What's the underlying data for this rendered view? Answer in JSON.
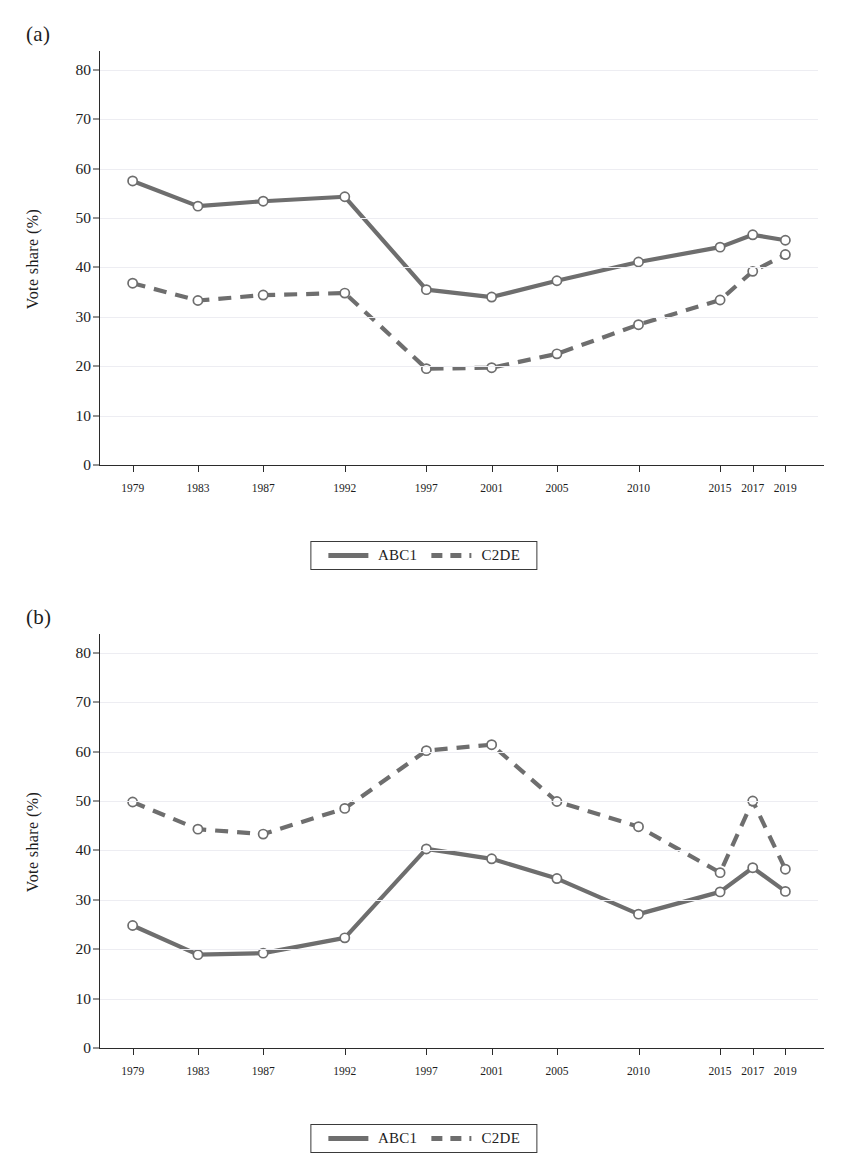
{
  "figure": {
    "panels": [
      {
        "label": "(a)",
        "ylabel": "Vote share (%)"
      },
      {
        "label": "(b)",
        "ylabel": "Vote share (%)"
      }
    ]
  },
  "style": {
    "series_color": "#6e6e6e",
    "marker_fill": "#ffffff",
    "marker_stroke": "#6e6e6e",
    "axis_color": "#2b2b2b",
    "grid_color": "#ededf2",
    "background": "#ffffff"
  },
  "chart_data": [
    {
      "type": "line",
      "panel": "(a)",
      "title": "",
      "xlabel": "",
      "ylabel": "Vote share (%)",
      "x": [
        1979,
        1983,
        1987,
        1992,
        1997,
        2001,
        2005,
        2010,
        2015,
        2017,
        2019
      ],
      "categories": [
        "1979",
        "1983",
        "1987",
        "1992",
        "1997",
        "2001",
        "2005",
        "2010",
        "2015",
        "2017",
        "2019"
      ],
      "xlim": [
        1977,
        2021
      ],
      "ylim": [
        0,
        83
      ],
      "yticks": [
        0,
        10,
        20,
        30,
        40,
        50,
        60,
        70,
        80
      ],
      "ytick_labels": [
        "0",
        "10",
        "20",
        "30",
        "40",
        "50",
        "60",
        "70",
        "80"
      ],
      "grid": true,
      "grid_axis": "y",
      "legend_position": "bottom-center",
      "series": [
        {
          "name": "ABC1",
          "linestyle": "solid",
          "values": [
            57.5,
            52.4,
            53.4,
            54.3,
            35.5,
            34.0,
            37.3,
            41.1,
            44.1,
            46.6,
            45.5
          ]
        },
        {
          "name": "C2DE",
          "linestyle": "dashed",
          "values": [
            36.8,
            33.3,
            34.4,
            34.8,
            19.5,
            19.7,
            22.5,
            28.4,
            33.4,
            39.2,
            42.6
          ]
        }
      ]
    },
    {
      "type": "line",
      "panel": "(b)",
      "title": "",
      "xlabel": "",
      "ylabel": "Vote share (%)",
      "x": [
        1979,
        1983,
        1987,
        1992,
        1997,
        2001,
        2005,
        2010,
        2015,
        2017,
        2019
      ],
      "categories": [
        "1979",
        "1983",
        "1987",
        "1992",
        "1997",
        "2001",
        "2005",
        "2010",
        "2015",
        "2017",
        "2019"
      ],
      "xlim": [
        1977,
        2021
      ],
      "ylim": [
        0,
        83
      ],
      "yticks": [
        0,
        10,
        20,
        30,
        40,
        50,
        60,
        70,
        80
      ],
      "ytick_labels": [
        "0",
        "10",
        "20",
        "30",
        "40",
        "50",
        "60",
        "70",
        "80"
      ],
      "grid": true,
      "grid_axis": "y",
      "legend_position": "bottom-center",
      "series": [
        {
          "name": "ABC1",
          "linestyle": "solid",
          "values": [
            24.8,
            18.9,
            19.2,
            22.3,
            40.3,
            38.3,
            34.3,
            27.1,
            31.6,
            36.5,
            31.7
          ]
        },
        {
          "name": "C2DE",
          "linestyle": "dashed",
          "values": [
            49.8,
            44.3,
            43.3,
            48.5,
            60.2,
            61.4,
            49.9,
            44.8,
            35.5,
            50.0,
            36.2
          ]
        }
      ]
    }
  ]
}
